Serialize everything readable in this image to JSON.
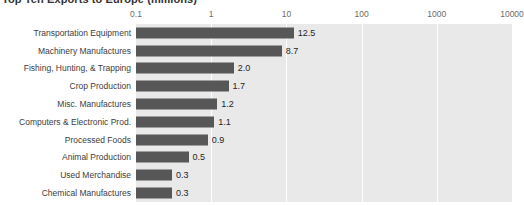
{
  "chart_data": {
    "type": "bar",
    "orientation": "horizontal",
    "title": "Top Ten Exports to Europe (millions)",
    "xlabel": "",
    "ylabel": "",
    "xscale": "log",
    "xlim": [
      0.1,
      10000
    ],
    "xticks": [
      "0.1",
      "1",
      "10",
      "100",
      "1000",
      "10000"
    ],
    "xtick_values": [
      0.1,
      1,
      10,
      100,
      1000,
      10000
    ],
    "grid": true,
    "grid_axis": "x",
    "legend": false,
    "bar_color": "#575757",
    "plot_background": "#e9e9e9",
    "gridline_color": "#ffffff",
    "categories": [
      "Transportation Equipment",
      "Machinery Manufactures",
      "Fishing, Hunting, & Trapping",
      "Crop Production",
      "Misc. Manufactures",
      "Computers & Electronic Prod.",
      "Processed Foods",
      "Animal Production",
      "Used Merchandise",
      "Chemical Manufactures"
    ],
    "values": [
      12.5,
      8.7,
      2.0,
      1.7,
      1.2,
      1.1,
      0.9,
      0.5,
      0.3,
      0.3
    ],
    "data_labels": [
      "12.5",
      "8.7",
      "2.0",
      "1.7",
      "1.2",
      "1.1",
      "0.9",
      "0.5",
      "0.3",
      "0.3"
    ]
  }
}
